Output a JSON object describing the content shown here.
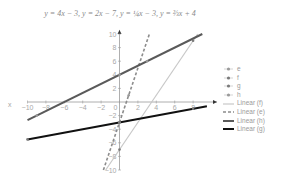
{
  "chart_data": {
    "type": "line",
    "title": "y = 4x − 3, y = 2x − 7, y = ¼x − 3, y = ⅔x + 4",
    "xlabel": "x",
    "ylabel": "",
    "xlim": [
      -10,
      10
    ],
    "ylim": [
      -10,
      10
    ],
    "x_ticks": [
      -10,
      -8,
      -6,
      -4,
      -2,
      0,
      2,
      4,
      6,
      8
    ],
    "y_ticks": [
      10,
      8,
      6,
      4,
      2,
      -2,
      -4,
      -6,
      -8,
      -10
    ],
    "grid": false,
    "legend_position": "right",
    "series": [
      {
        "name": "e",
        "kind": "marker",
        "marker": "diamond",
        "color": "#9a9a9a",
        "points": [
          [
            0,
            -3
          ],
          [
            1,
            1
          ]
        ]
      },
      {
        "name": "f",
        "kind": "marker",
        "marker": "square",
        "color": "#7a7a7a",
        "points": [
          [
            0,
            -7
          ],
          [
            8,
            9
          ]
        ]
      },
      {
        "name": "g",
        "kind": "marker",
        "marker": "triangle",
        "color": "#7a7a7a",
        "points": [
          [
            -10,
            -5.5
          ],
          [
            0,
            -3
          ],
          [
            8,
            -1
          ]
        ]
      },
      {
        "name": "h",
        "kind": "marker",
        "marker": "x",
        "color": "#9a9a9a",
        "points": [
          [
            -9,
            -2
          ],
          [
            0,
            4
          ],
          [
            3,
            6
          ]
        ]
      },
      {
        "name": "Linear (f)",
        "kind": "trend",
        "equation": "y = 2x - 7",
        "slope": 2,
        "intercept": -7,
        "x_range": [
          -1.5,
          8.5
        ],
        "color": "#c8c8c8",
        "width": 1.2,
        "dash": ""
      },
      {
        "name": "Linear (e)",
        "kind": "trend",
        "equation": "y = 4x - 3",
        "slope": 4,
        "intercept": -3,
        "x_range": [
          -1.75,
          3.25
        ],
        "color": "#8c8c8c",
        "width": 1.6,
        "dash": "3,2"
      },
      {
        "name": "Linear (h)",
        "kind": "trend",
        "equation": "y = 2/3x + 4",
        "slope": 0.6667,
        "intercept": 4,
        "x_range": [
          -10,
          9
        ],
        "color": "#5a5a5a",
        "width": 2,
        "dash": ""
      },
      {
        "name": "Linear (g)",
        "kind": "trend",
        "equation": "y = 1/4x - 3",
        "slope": 0.25,
        "intercept": -3,
        "x_range": [
          -10,
          9.5
        ],
        "color": "#111111",
        "width": 2,
        "dash": ""
      }
    ]
  },
  "legend": {
    "items": [
      "e",
      "f",
      "g",
      "h",
      "Linear (f)",
      "Linear (e)",
      "Linear (h)",
      "Linear (g)"
    ]
  }
}
